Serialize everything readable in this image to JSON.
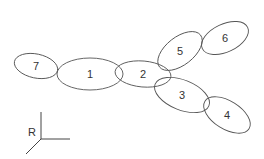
{
  "diagram": {
    "nodes": [
      {
        "label": "7",
        "cx": 36,
        "cy": 66,
        "rx": 22,
        "ry": 12,
        "rot": 12
      },
      {
        "label": "1",
        "cx": 90,
        "cy": 74,
        "rx": 33,
        "ry": 16,
        "rot": 0
      },
      {
        "label": "2",
        "cx": 143,
        "cy": 74,
        "rx": 28,
        "ry": 13,
        "rot": 5
      },
      {
        "label": "5",
        "cx": 180,
        "cy": 51,
        "rx": 26,
        "ry": 14,
        "rot": -38
      },
      {
        "label": "6",
        "cx": 225,
        "cy": 38,
        "rx": 25,
        "ry": 14,
        "rot": -25
      },
      {
        "label": "3",
        "cx": 182,
        "cy": 95,
        "rx": 29,
        "ry": 15,
        "rot": 22
      },
      {
        "label": "4",
        "cx": 227,
        "cy": 115,
        "rx": 26,
        "ry": 14,
        "rot": 32
      }
    ],
    "axis": {
      "label": "R",
      "ox": 41,
      "oy": 139
    }
  }
}
